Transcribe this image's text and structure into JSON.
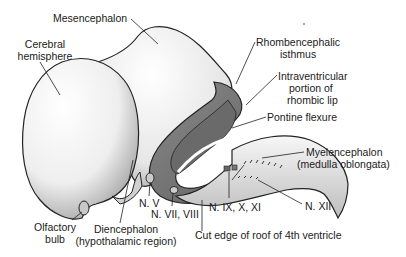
{
  "diagram": {
    "type": "anatomical-illustration",
    "labels": {
      "mesencephalon": "Mesencephalon",
      "cerebral_hemisphere_1": "Cerebral",
      "cerebral_hemisphere_2": "hemisphere",
      "rhombencephalic_isthmus_1": "Rhombencephalic",
      "rhombencephalic_isthmus_2": "isthmus",
      "intraventricular_1": "Intraventricular",
      "intraventricular_2": "portion of",
      "intraventricular_3": "rhombic lip",
      "pontine_flexure": "Pontine flexure",
      "myelencephalon_1": "Myelencephalon",
      "myelencephalon_2": "(medulla oblongata)",
      "n_v": "N. V",
      "n_vii_viii": "N. VII, VIII",
      "n_ix_x_xi": "N. IX, X, XI",
      "n_xii": "N. XII",
      "olfactory_bulb_1": "Olfactory",
      "olfactory_bulb_2": "bulb",
      "diencephalon_1": "Diencephalon",
      "diencephalon_2": "(hypothalamic region)",
      "cut_edge": "Cut edge of roof of 4th ventricle"
    },
    "colors": {
      "outline": "#222222",
      "surface": "#f2f2f2",
      "shade": "#9a9a9a",
      "inner": "#7a7a7a"
    }
  }
}
